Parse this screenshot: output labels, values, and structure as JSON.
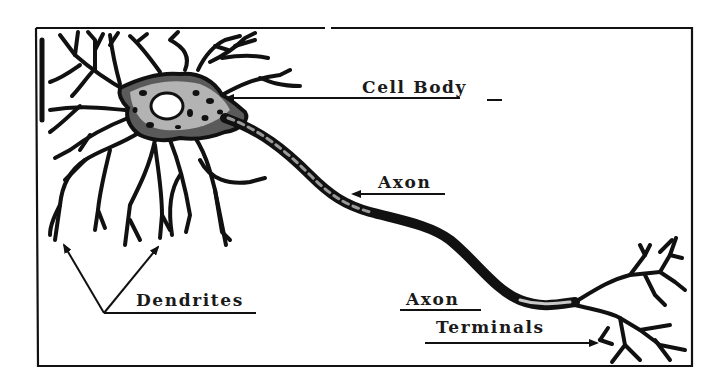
{
  "diagram": {
    "colors": {
      "ink": "#111111",
      "background": "#ffffff"
    },
    "labels": [
      {
        "id": "cell_body",
        "text": "Cell Body",
        "suffix": "_"
      },
      {
        "id": "axon",
        "text": "Axon"
      },
      {
        "id": "axon_terminals_line1",
        "text": "Axon"
      },
      {
        "id": "axon_terminals_line2",
        "text": "Terminals"
      },
      {
        "id": "dendrites",
        "text": "Dendrites"
      }
    ],
    "parts": [
      "dendrites",
      "cell-body",
      "nucleus",
      "axon",
      "axon-terminals"
    ]
  }
}
